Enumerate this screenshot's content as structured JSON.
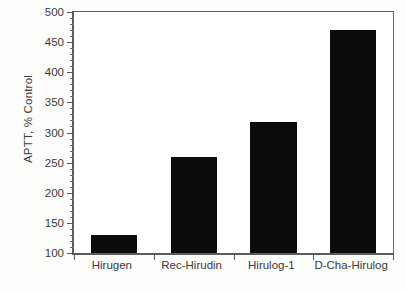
{
  "chart_data": {
    "type": "bar",
    "title": "",
    "xlabel": "",
    "ylabel": "APTT, % Control",
    "categories": [
      "Hirugen",
      "Rec-Hirudin",
      "Hirulog-1",
      "D-Cha-Hirulog"
    ],
    "values": [
      130,
      260,
      318,
      470
    ],
    "ylim": [
      100,
      500
    ],
    "ytick_labels": [
      "100",
      "150",
      "200",
      "250",
      "300",
      "350",
      "400",
      "450",
      "500"
    ],
    "ytick_values": [
      100,
      150,
      200,
      250,
      300,
      350,
      400,
      450,
      500
    ],
    "ymajor_step": 50,
    "yminor_step": 10,
    "grid": false,
    "legend": null,
    "bar_color": "#0b0b0b",
    "axis_color": "#5b5b5b",
    "text_color": "#3a3a3a",
    "background_color": "#fdfdfb",
    "plot_background_color": "#ffffff"
  }
}
